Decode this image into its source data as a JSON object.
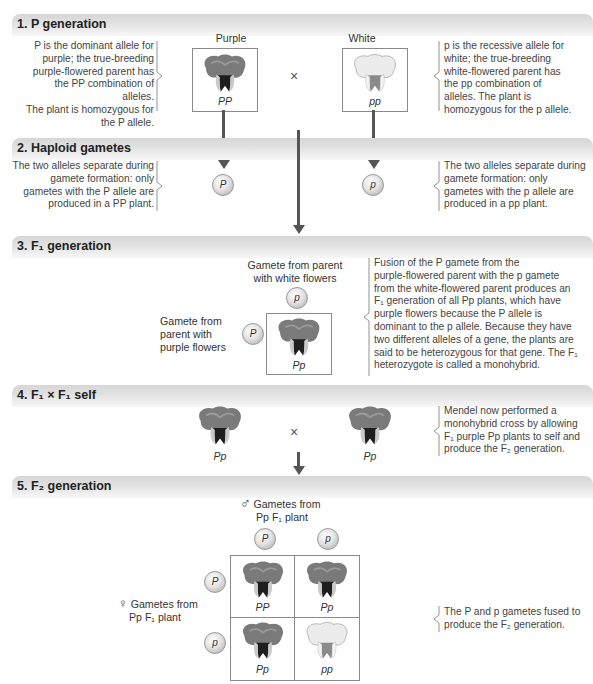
{
  "sections": [
    {
      "number": "1.",
      "title": "P generation"
    },
    {
      "number": "2.",
      "title": "Haploid gametes"
    },
    {
      "number": "3.",
      "title": "F₁ generation"
    },
    {
      "number": "4.",
      "title": "F₁ × F₁ self"
    },
    {
      "number": "5.",
      "title": "F₂ generation"
    }
  ],
  "p_generation": {
    "purple_label": "Purple",
    "white_label": "White",
    "purple_genotype": "PP",
    "white_genotype": "pp",
    "cross_symbol": "×",
    "left_text": [
      "P is the dominant allele for",
      "purple; the true-breeding",
      "purple-flowered parent has",
      "the PP combination of alleles.",
      "The plant is homozygous for",
      "the P allele."
    ],
    "right_text": [
      "p is the recessive allele for",
      "white; the true-breeding",
      "white-flowered parent has",
      "the pp combination of",
      "alleles. The plant is",
      "homozygous for the p allele."
    ]
  },
  "haploid_gametes": {
    "left_gamete": "P",
    "right_gamete": "p",
    "left_text": [
      "The two alleles separate during",
      "gamete formation: only",
      "gametes with the P allele are",
      "produced in a PP plant."
    ],
    "right_text": [
      "The two alleles separate during",
      "gamete formation: only",
      "gametes with the p allele are",
      "produced in a pp plant."
    ]
  },
  "f1_generation": {
    "top_label": [
      "Gamete from parent",
      "with white flowers"
    ],
    "left_label": [
      "Gamete from",
      "parent with",
      "purple flowers"
    ],
    "top_gamete": "p",
    "left_gamete": "P",
    "genotype": "Pp",
    "text": [
      "Fusion of the P gamete from the",
      "purple-flowered parent with the p gamete",
      "from the white-flowered parent produces an",
      "F₁ generation of all Pp plants, which have",
      "purple flowers because the P allele is",
      "dominant to the p allele. Because they have",
      "two different alleles of a gene, the plants are",
      "said to be heterozygous for that gene. The F₁",
      "heterozygote is called a monohybrid."
    ]
  },
  "f1_self": {
    "left_genotype": "Pp",
    "right_genotype": "Pp",
    "cross_symbol": "×",
    "text": [
      "Mendel now performed a",
      "monohybrid cross by allowing",
      "F₁ purple Pp plants to self and",
      "produce the F₂ generation."
    ]
  },
  "f2_generation": {
    "male_symbol": "♂",
    "female_symbol": "♀",
    "male_label": [
      "Gametes from",
      "Pp F₁ plant"
    ],
    "female_label": [
      "Gametes from",
      "Pp F₁ plant"
    ],
    "top_gametes": [
      "P",
      "p"
    ],
    "left_gametes": [
      "P",
      "p"
    ],
    "cells": [
      {
        "genotype": "PP",
        "color": "purple"
      },
      {
        "genotype": "Pp",
        "color": "purple"
      },
      {
        "genotype": "Pp",
        "color": "purple"
      },
      {
        "genotype": "pp",
        "color": "white"
      }
    ],
    "text": [
      "The P and p gametes fused to",
      "produce the F₂ generation."
    ]
  },
  "colors": {
    "bar_dark": "#d6d6d6",
    "bar_light": "#f7f7f7",
    "arrow": "#555555",
    "purple_petal": "#7a7a7a",
    "white_petal": "#e6e6e6"
  }
}
